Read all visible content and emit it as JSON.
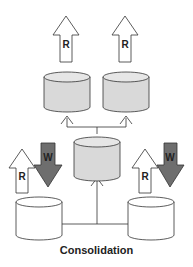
{
  "diagram": {
    "caption": "Consolidation",
    "read_label": "R",
    "write_label": "W",
    "colors": {
      "db_fill_shaded": "#d9d9d9",
      "db_fill_plain": "#ffffff",
      "write_arrow": "#6e6e6e",
      "read_arrow": "#ffffff",
      "stroke": "#333333"
    },
    "nodes": [
      {
        "id": "top-left-db",
        "type": "database",
        "shaded": true,
        "arrows": [
          "R"
        ]
      },
      {
        "id": "top-right-db",
        "type": "database",
        "shaded": true,
        "arrows": [
          "R"
        ]
      },
      {
        "id": "center-db",
        "type": "database",
        "shaded": true,
        "arrows": []
      },
      {
        "id": "bottom-left-db",
        "type": "database",
        "shaded": false,
        "arrows": [
          "R",
          "W"
        ]
      },
      {
        "id": "bottom-right-db",
        "type": "database",
        "shaded": false,
        "arrows": [
          "R",
          "W"
        ]
      }
    ],
    "edges": [
      {
        "from": "bottom-left-db",
        "to": "center-db"
      },
      {
        "from": "bottom-right-db",
        "to": "center-db"
      },
      {
        "from": "center-db",
        "to": "top-left-db"
      },
      {
        "from": "center-db",
        "to": "top-right-db"
      }
    ]
  }
}
